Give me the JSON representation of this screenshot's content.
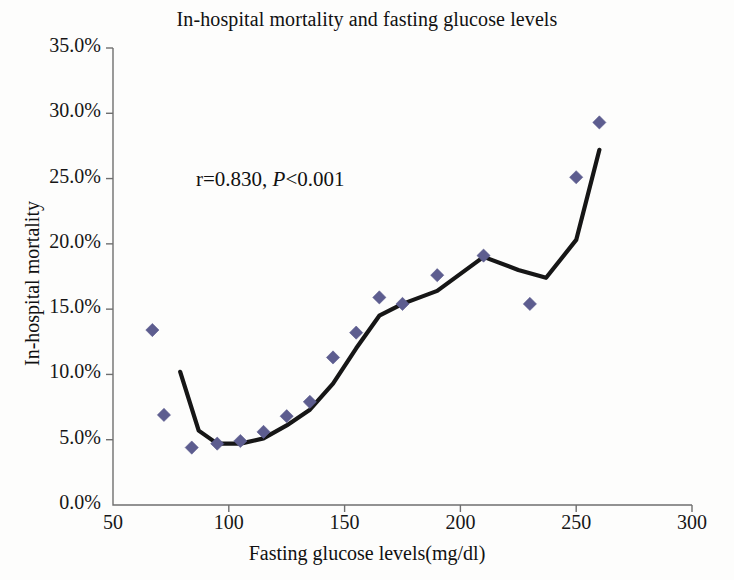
{
  "chart_data": {
    "type": "scatter",
    "title": "In-hospital mortality and fasting glucose levels",
    "xlabel": "Fasting glucose levels(mg/dl)",
    "ylabel": "In-hospital mortality",
    "xlim": [
      50,
      300
    ],
    "ylim": [
      0,
      35
    ],
    "xticks": [
      50,
      100,
      150,
      200,
      250,
      300
    ],
    "xtick_labels": [
      "50",
      "100",
      "150",
      "200",
      "250",
      "300"
    ],
    "yticks": [
      0,
      5,
      10,
      15,
      20,
      25,
      30,
      35
    ],
    "ytick_labels": [
      "0.0%",
      "5.0%",
      "10.0%",
      "15.0%",
      "20.0%",
      "25.0%",
      "30.0%",
      "35.0%"
    ],
    "grid": false,
    "legend": "none",
    "marker_color": "#5d5d8f",
    "line_color": "#161616",
    "annotation": {
      "r_text": "r=0.830, ",
      "p_text": "P",
      "p_tail": "<0.001",
      "full": "r=0.830, P<0.001",
      "x": 118,
      "y": 23.0
    },
    "series": [
      {
        "name": "In-hospital mortality by glucose level",
        "marker": "diamond",
        "points": [
          {
            "x": 67,
            "y": 13.4
          },
          {
            "x": 72,
            "y": 6.9
          },
          {
            "x": 84,
            "y": 4.4
          },
          {
            "x": 95,
            "y": 4.7
          },
          {
            "x": 105,
            "y": 4.9
          },
          {
            "x": 115,
            "y": 5.6
          },
          {
            "x": 125,
            "y": 6.8
          },
          {
            "x": 135,
            "y": 7.9
          },
          {
            "x": 145,
            "y": 11.3
          },
          {
            "x": 155,
            "y": 13.2
          },
          {
            "x": 165,
            "y": 15.9
          },
          {
            "x": 175,
            "y": 15.4
          },
          {
            "x": 190,
            "y": 17.6
          },
          {
            "x": 210,
            "y": 19.1
          },
          {
            "x": 230,
            "y": 15.4
          },
          {
            "x": 250,
            "y": 25.1
          },
          {
            "x": 260,
            "y": 29.3
          }
        ]
      },
      {
        "name": "Fitted trend line",
        "marker": "none",
        "points": [
          {
            "x": 79,
            "y": 10.2
          },
          {
            "x": 87,
            "y": 5.7
          },
          {
            "x": 95,
            "y": 4.7
          },
          {
            "x": 105,
            "y": 4.7
          },
          {
            "x": 115,
            "y": 5.1
          },
          {
            "x": 125,
            "y": 6.1
          },
          {
            "x": 135,
            "y": 7.3
          },
          {
            "x": 145,
            "y": 9.3
          },
          {
            "x": 155,
            "y": 12.0
          },
          {
            "x": 165,
            "y": 14.5
          },
          {
            "x": 175,
            "y": 15.4
          },
          {
            "x": 190,
            "y": 16.4
          },
          {
            "x": 210,
            "y": 19.0
          },
          {
            "x": 225,
            "y": 18.0
          },
          {
            "x": 237,
            "y": 17.4
          },
          {
            "x": 250,
            "y": 20.3
          },
          {
            "x": 260,
            "y": 27.2
          }
        ]
      }
    ]
  }
}
